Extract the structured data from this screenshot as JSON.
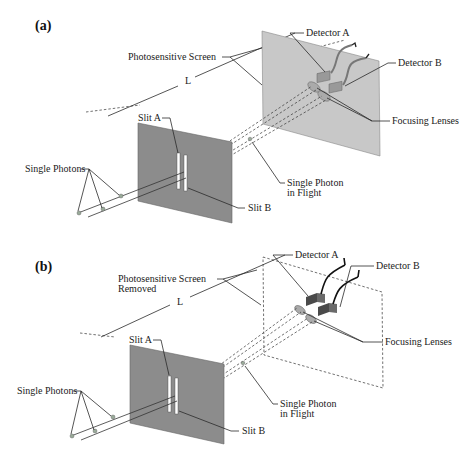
{
  "figure": {
    "panels": [
      {
        "id": "a",
        "label": "(a)",
        "screen_label": "Photosensitive Screen",
        "screen_label_line2": "",
        "distance_label": "L",
        "slit_a": "Slit A",
        "slit_b": "Slit B",
        "photons": "Single Photons",
        "photon_flight_1": "Single Photon",
        "photon_flight_2": "in Flight",
        "detector_a": "Detector A",
        "detector_b": "Detector B",
        "lenses": "Focusing Lenses"
      },
      {
        "id": "b",
        "label": "(b)",
        "screen_label": "Photosensitive Screen",
        "screen_label_line2": "Removed",
        "distance_label": "L",
        "slit_a": "Slit A",
        "slit_b": "Slit B",
        "photons": "Single Photons",
        "photon_flight_1": "Single Photon",
        "photon_flight_2": "in Flight",
        "detector_a": "Detector A",
        "detector_b": "Detector B",
        "lenses": "Focusing Lenses"
      }
    ],
    "colors": {
      "slit_screen": "#8c8c8c",
      "photo_screen": "#c8c8c8",
      "detector": "#9a9a9a",
      "detector_dark": "#4a4a4a"
    }
  }
}
